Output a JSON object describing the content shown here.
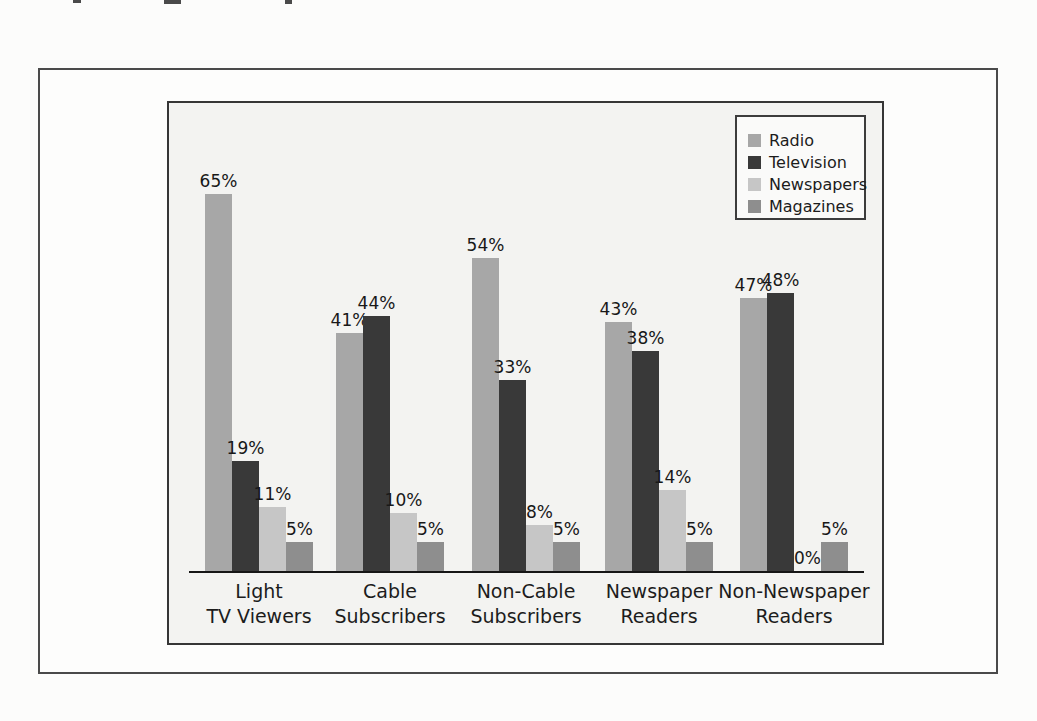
{
  "chart_data": {
    "type": "bar",
    "title": "",
    "xlabel": "",
    "ylabel": "",
    "value_label_format": "{v}%",
    "ylim": [
      0,
      81
    ],
    "grid": false,
    "legend_position": "top-right",
    "categories": [
      "Light TV Viewers",
      "Cable Subscribers",
      "Non-Cable Subscribers",
      "Newspaper Readers",
      "Non-Newspaper Readers"
    ],
    "category_lines": [
      [
        "Light",
        "TV Viewers"
      ],
      [
        "Cable",
        "Subscribers"
      ],
      [
        "Non-Cable",
        "Subscribers"
      ],
      [
        "Newspaper",
        "Readers"
      ],
      [
        "Non-Newspaper",
        "Readers"
      ]
    ],
    "series": [
      {
        "name": "Radio",
        "color": "#a7a7a7",
        "values": [
          65,
          41,
          54,
          43,
          47
        ]
      },
      {
        "name": "Television",
        "color": "#393939",
        "values": [
          19,
          44,
          33,
          38,
          48
        ]
      },
      {
        "name": "Newspapers",
        "color": "#c6c6c6",
        "values": [
          11,
          10,
          8,
          14,
          0
        ]
      },
      {
        "name": "Magazines",
        "color": "#8e8e8e",
        "values": [
          5,
          5,
          5,
          5,
          5
        ]
      }
    ]
  }
}
